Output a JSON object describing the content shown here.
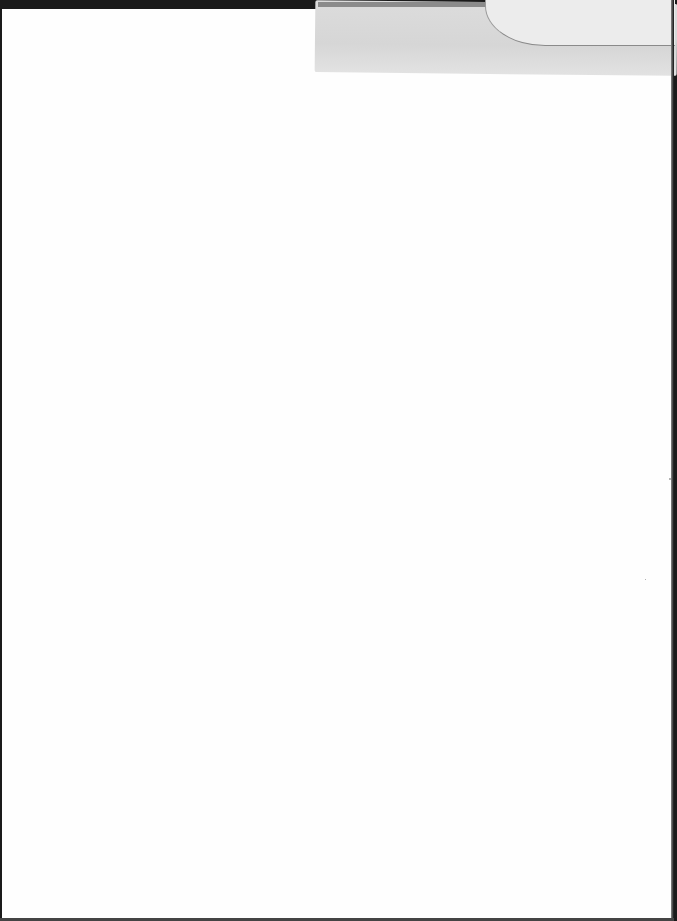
{
  "document": {
    "type": "scanned-page",
    "content": "",
    "colors": {
      "paper": "#fefefe",
      "tape": "#d8d8d8",
      "scan_border": "#1a1a1a"
    }
  }
}
